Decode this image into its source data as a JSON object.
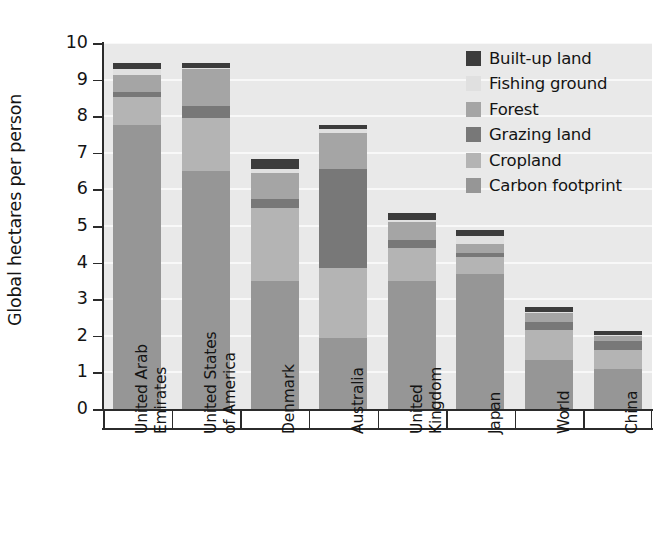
{
  "chart_data": {
    "type": "bar",
    "subtype": "stacked-bar",
    "title": "",
    "xlabel": "",
    "ylabel": "Global hectares per person",
    "ylim": [
      0,
      10
    ],
    "ytick_labels": [
      "0",
      "1",
      "2",
      "3",
      "4",
      "5",
      "6",
      "7",
      "8",
      "9",
      "10"
    ],
    "ytick_values": [
      0,
      1,
      2,
      3,
      4,
      5,
      6,
      7,
      8,
      9,
      10
    ],
    "grid": "horizontal-white",
    "legend_position": "top-right-inside",
    "categories": [
      "United Arab Emirates",
      "United States of America",
      "Denmark",
      "Australia",
      "United Kingdom",
      "Japan",
      "World",
      "China"
    ],
    "category_label_lines": [
      [
        "United Arab",
        "Emirates"
      ],
      [
        "United States",
        "of America"
      ],
      [
        "Denmark"
      ],
      [
        "Australia"
      ],
      [
        "United",
        "Kingdom"
      ],
      [
        "Japan"
      ],
      [
        "World"
      ],
      [
        "China"
      ]
    ],
    "series": [
      {
        "name": "Carbon footprint",
        "color": "#969696",
        "values": [
          7.75,
          6.5,
          3.5,
          1.95,
          3.5,
          3.7,
          1.35,
          1.1
        ]
      },
      {
        "name": "Cropland",
        "color": "#b4b4b4",
        "values": [
          0.78,
          1.45,
          2.0,
          1.9,
          0.9,
          0.45,
          0.8,
          0.5
        ]
      },
      {
        "name": "Grazing land",
        "color": "#787878",
        "values": [
          0.14,
          0.33,
          0.25,
          2.7,
          0.22,
          0.12,
          0.24,
          0.27
        ]
      },
      {
        "name": "Forest",
        "color": "#a5a5a5",
        "values": [
          0.45,
          1.0,
          0.7,
          1.0,
          0.5,
          0.25,
          0.22,
          0.13
        ]
      },
      {
        "name": "Fishing ground",
        "color": "#e0e0e0",
        "values": [
          0.18,
          0.05,
          0.1,
          0.1,
          0.05,
          0.22,
          0.03,
          0.02
        ]
      },
      {
        "name": "Built-up land",
        "color": "#3c3c3c",
        "values": [
          0.15,
          0.12,
          0.27,
          0.12,
          0.18,
          0.16,
          0.14,
          0.11
        ]
      }
    ],
    "totals": [
      9.45,
      9.45,
      8.0,
      7.8,
      5.3,
      4.85,
      2.68,
      2.08
    ],
    "plot_background": "#e9e9e9",
    "gridline_color": "#f8f8f8",
    "axis_color": "#2b2b2b"
  },
  "legend": {
    "items": [
      {
        "label": "Built-up land",
        "color": "#3c3c3c"
      },
      {
        "label": "Fishing ground",
        "color": "#e0e0e0"
      },
      {
        "label": "Forest",
        "color": "#a5a5a5"
      },
      {
        "label": "Grazing land",
        "color": "#787878"
      },
      {
        "label": "Cropland",
        "color": "#b4b4b4"
      },
      {
        "label": "Carbon footprint",
        "color": "#969696"
      }
    ]
  }
}
